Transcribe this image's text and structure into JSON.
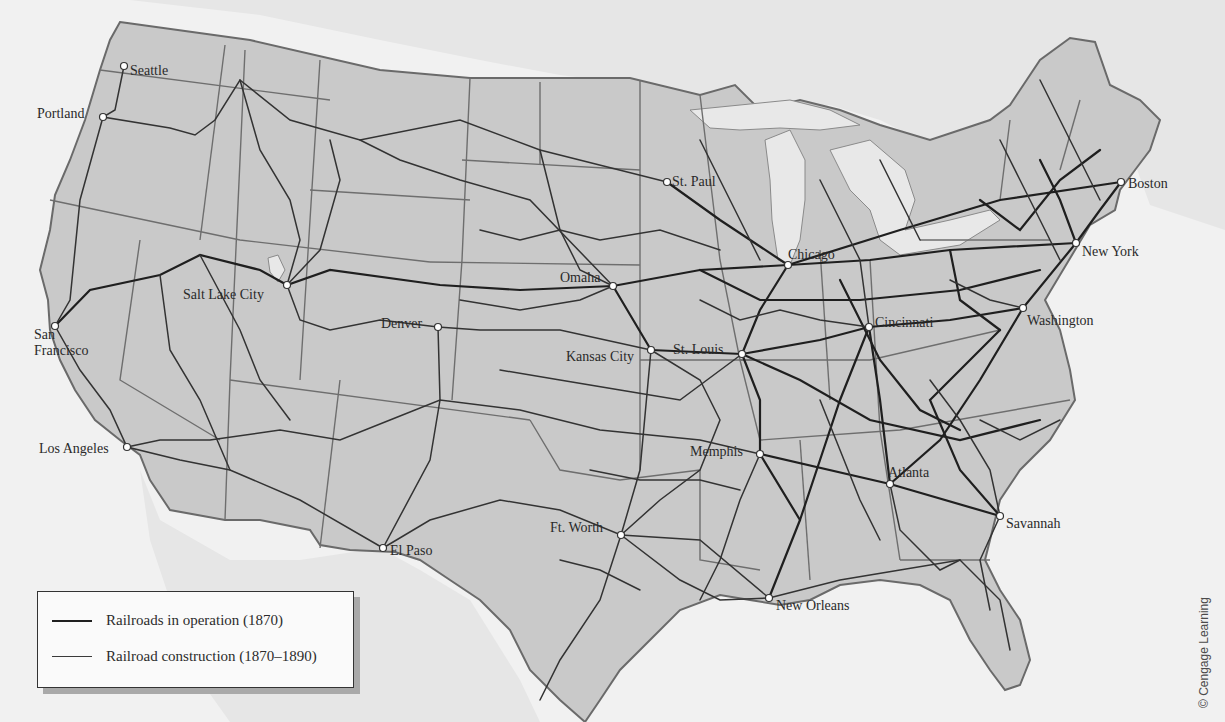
{
  "map": {
    "colors": {
      "land_us": "#c8c8c8",
      "land_foreign": "#e4e4e4",
      "water": "#f1f1f1",
      "border": "#6e6e6e",
      "rail_1870": "#1e1e1e",
      "rail_1870_1890": "#3a3a3a",
      "city_marker": "#ffffff"
    },
    "cities": [
      {
        "name": "Seattle",
        "x": 124,
        "y": 66
      },
      {
        "name": "Portland",
        "x": 103,
        "y": 117
      },
      {
        "name": "Salt Lake City",
        "x": 287,
        "y": 285
      },
      {
        "name": "San Francisco",
        "x": 55,
        "y": 326
      },
      {
        "name": "Denver",
        "x": 438,
        "y": 327
      },
      {
        "name": "Los Angeles",
        "x": 127,
        "y": 447
      },
      {
        "name": "El Paso",
        "x": 383,
        "y": 548
      },
      {
        "name": "St. Paul",
        "x": 667,
        "y": 182
      },
      {
        "name": "Omaha",
        "x": 613,
        "y": 286
      },
      {
        "name": "Kansas City",
        "x": 651,
        "y": 350
      },
      {
        "name": "St. Louis",
        "x": 742,
        "y": 354
      },
      {
        "name": "Chicago",
        "x": 788,
        "y": 265
      },
      {
        "name": "Cincinnati",
        "x": 869,
        "y": 327
      },
      {
        "name": "Washington",
        "x": 1023,
        "y": 308
      },
      {
        "name": "New York",
        "x": 1076,
        "y": 243
      },
      {
        "name": "Boston",
        "x": 1121,
        "y": 182
      },
      {
        "name": "Memphis",
        "x": 760,
        "y": 454
      },
      {
        "name": "Atlanta",
        "x": 890,
        "y": 484
      },
      {
        "name": "Savannah",
        "x": 1000,
        "y": 516
      },
      {
        "name": "Ft. Worth",
        "x": 621,
        "y": 535
      },
      {
        "name": "New Orleans",
        "x": 769,
        "y": 598
      }
    ],
    "labels": [
      {
        "text": "Seattle",
        "x": 130,
        "y": 63
      },
      {
        "text": "Portland",
        "x": 37,
        "y": 106
      },
      {
        "text": "Salt Lake City",
        "x": 183,
        "y": 287
      },
      {
        "text": "San",
        "x": 34,
        "y": 327
      },
      {
        "text": "Francisco",
        "x": 34,
        "y": 343
      },
      {
        "text": "Denver",
        "x": 381,
        "y": 316
      },
      {
        "text": "Los Angeles",
        "x": 39,
        "y": 441
      },
      {
        "text": "El Paso",
        "x": 390,
        "y": 543
      },
      {
        "text": "St. Paul",
        "x": 672,
        "y": 174
      },
      {
        "text": "Omaha",
        "x": 560,
        "y": 270
      },
      {
        "text": "Kansas City",
        "x": 566,
        "y": 349
      },
      {
        "text": "St. Louis",
        "x": 673,
        "y": 342
      },
      {
        "text": "Chicago",
        "x": 788,
        "y": 247
      },
      {
        "text": "Cincinnati",
        "x": 875,
        "y": 315
      },
      {
        "text": "Washington",
        "x": 1027,
        "y": 313
      },
      {
        "text": "New York",
        "x": 1082,
        "y": 244
      },
      {
        "text": "Boston",
        "x": 1128,
        "y": 176
      },
      {
        "text": "Memphis",
        "x": 690,
        "y": 444
      },
      {
        "text": "Atlanta",
        "x": 888,
        "y": 465
      },
      {
        "text": "Savannah",
        "x": 1006,
        "y": 516
      },
      {
        "text": "Ft. Worth",
        "x": 550,
        "y": 520
      },
      {
        "text": "New Orleans",
        "x": 776,
        "y": 598
      }
    ]
  },
  "legend": {
    "items": [
      {
        "label": "Railroads in operation (1870)",
        "style": "thick-dark"
      },
      {
        "label": "Railroad construction (1870–1890)",
        "style": "thin-dark"
      }
    ]
  },
  "credit": "© Cengage Learning"
}
